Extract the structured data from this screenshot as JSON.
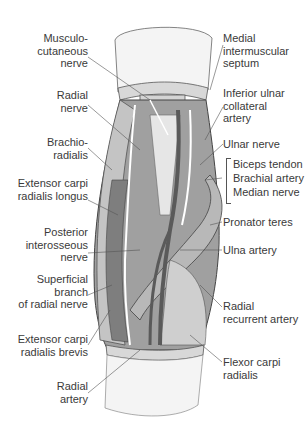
{
  "figure": {
    "colors": {
      "muscle": "#8a8a8a",
      "muscle_light": "#c8c8c8",
      "tendon": "#e2e2e2",
      "skin": "#f2f2f2",
      "vessel": "#5a5a5a",
      "nerve": "#ffffff",
      "outline": "#444444",
      "leader_line": "#555555",
      "text": "#3a3a3a"
    }
  },
  "labels_left": [
    {
      "id": "musculocutaneous-nerve",
      "text": "Musculo-\ncutaneous\nnerve"
    },
    {
      "id": "radial-nerve",
      "text": "Radial\nnerve"
    },
    {
      "id": "brachioradialis",
      "text": "Brachio-\nradialis"
    },
    {
      "id": "extensor-carpi-radialis-longus",
      "text": "Extensor carpi\nradialis longus"
    },
    {
      "id": "posterior-interosseous-nerve",
      "text": "Posterior\ninterosseous\nnerve"
    },
    {
      "id": "superficial-branch-radial-nerve",
      "text": "Superficial\nbranch\nof radial nerve"
    },
    {
      "id": "extensor-carpi-radialis-brevis",
      "text": "Extensor carpi\nradialis brevis"
    },
    {
      "id": "radial-artery",
      "text": "Radial\nartery"
    }
  ],
  "labels_right": [
    {
      "id": "medial-intermuscular-septum",
      "text": "Medial\nintermuscular\nseptum"
    },
    {
      "id": "inferior-ulnar-collateral-artery",
      "text": "Inferior ulnar\ncollateral\nartery"
    },
    {
      "id": "ulnar-nerve",
      "text": "Ulnar nerve"
    },
    {
      "id": "biceps-tendon",
      "text": "Biceps tendon"
    },
    {
      "id": "brachial-artery",
      "text": "Brachial artery"
    },
    {
      "id": "median-nerve",
      "text": "Median nerve"
    },
    {
      "id": "pronator-teres",
      "text": "Pronator teres"
    },
    {
      "id": "ulna-artery",
      "text": "Ulna artery"
    },
    {
      "id": "radial-recurrent-artery",
      "text": "Radial\nrecurrent artery"
    },
    {
      "id": "flexor-carpi-radialis",
      "text": "Flexor carpi\nradialis"
    }
  ]
}
